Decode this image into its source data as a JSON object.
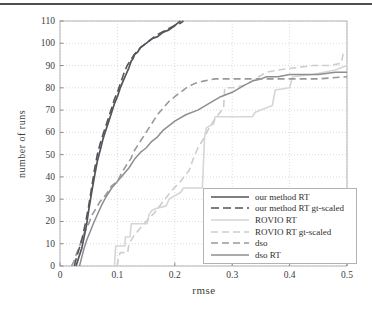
{
  "page": {
    "background": "#ffffff",
    "top_rule_color": "#4f4f4f"
  },
  "chart_data": {
    "type": "line",
    "title": "",
    "xlabel": "rmse",
    "ylabel": "number of runs",
    "xlim": [
      0,
      0.5
    ],
    "ylim": [
      0,
      110
    ],
    "grid": true,
    "legend_position": "lower-right",
    "frame_color": "#b3b3b3",
    "grid_color": "#dcdcdc",
    "tick_color": "#8a8a8a",
    "tick_label_color": "#3d3d3d",
    "xticks": {
      "values": [
        0,
        0.1,
        0.2,
        0.3,
        0.4,
        0.5
      ],
      "labels": [
        "0",
        "0.1",
        "0.2",
        "0.3",
        "0.4",
        "0.5"
      ]
    },
    "yticks": {
      "values": [
        0,
        10,
        20,
        30,
        40,
        50,
        60,
        70,
        80,
        90,
        100,
        110
      ],
      "labels": [
        "0",
        "10",
        "20",
        "30",
        "40",
        "50",
        "60",
        "70",
        "80",
        "90",
        "100",
        "110"
      ]
    },
    "series": [
      {
        "name": "our method RT",
        "color": "#54545a",
        "dash": "solid",
        "width": 1.7,
        "points": [
          [
            0.028,
            0
          ],
          [
            0.033,
            4
          ],
          [
            0.038,
            8
          ],
          [
            0.042,
            13
          ],
          [
            0.046,
            18
          ],
          [
            0.05,
            25
          ],
          [
            0.055,
            33
          ],
          [
            0.06,
            40
          ],
          [
            0.065,
            47
          ],
          [
            0.07,
            52
          ],
          [
            0.075,
            57
          ],
          [
            0.08,
            61
          ],
          [
            0.085,
            65
          ],
          [
            0.09,
            69
          ],
          [
            0.095,
            73
          ],
          [
            0.1,
            76
          ],
          [
            0.105,
            80
          ],
          [
            0.11,
            83
          ],
          [
            0.115,
            86
          ],
          [
            0.12,
            89
          ],
          [
            0.124,
            92
          ],
          [
            0.127,
            93
          ],
          [
            0.13,
            95
          ],
          [
            0.135,
            96
          ],
          [
            0.14,
            98
          ],
          [
            0.15,
            100
          ],
          [
            0.16,
            102
          ],
          [
            0.17,
            103
          ],
          [
            0.18,
            105
          ],
          [
            0.19,
            106
          ],
          [
            0.2,
            108
          ],
          [
            0.205,
            109
          ],
          [
            0.21,
            110
          ]
        ]
      },
      {
        "name": "our method RT gt-scaled",
        "color": "#54545a",
        "dash": "8,4",
        "width": 1.6,
        "points": [
          [
            0.025,
            0
          ],
          [
            0.03,
            5
          ],
          [
            0.036,
            10
          ],
          [
            0.04,
            14
          ],
          [
            0.045,
            20
          ],
          [
            0.05,
            27
          ],
          [
            0.055,
            35
          ],
          [
            0.06,
            43
          ],
          [
            0.065,
            50
          ],
          [
            0.07,
            55
          ],
          [
            0.075,
            59
          ],
          [
            0.08,
            63
          ],
          [
            0.085,
            67
          ],
          [
            0.09,
            71
          ],
          [
            0.095,
            75
          ],
          [
            0.1,
            78
          ],
          [
            0.104,
            81
          ],
          [
            0.108,
            84
          ],
          [
            0.112,
            87
          ],
          [
            0.117,
            90
          ],
          [
            0.122,
            92
          ],
          [
            0.127,
            94
          ],
          [
            0.133,
            96
          ],
          [
            0.14,
            98
          ],
          [
            0.15,
            100
          ],
          [
            0.16,
            102
          ],
          [
            0.17,
            104
          ],
          [
            0.185,
            106
          ],
          [
            0.2,
            108
          ],
          [
            0.21,
            109
          ],
          [
            0.215,
            110
          ]
        ]
      },
      {
        "name": "ROVIO RT",
        "color": "#d6d6d6",
        "dash": "solid",
        "width": 1.6,
        "points": [
          [
            0.095,
            0
          ],
          [
            0.096,
            5
          ],
          [
            0.097,
            9
          ],
          [
            0.113,
            9
          ],
          [
            0.114,
            13
          ],
          [
            0.122,
            13
          ],
          [
            0.124,
            19
          ],
          [
            0.152,
            19
          ],
          [
            0.155,
            23
          ],
          [
            0.16,
            25
          ],
          [
            0.17,
            26
          ],
          [
            0.185,
            27
          ],
          [
            0.19,
            30
          ],
          [
            0.196,
            31
          ],
          [
            0.21,
            33
          ],
          [
            0.215,
            35
          ],
          [
            0.248,
            35
          ],
          [
            0.252,
            58
          ],
          [
            0.255,
            62
          ],
          [
            0.268,
            64
          ],
          [
            0.27,
            67
          ],
          [
            0.335,
            67
          ],
          [
            0.34,
            69
          ],
          [
            0.37,
            72
          ],
          [
            0.372,
            75
          ],
          [
            0.375,
            79
          ],
          [
            0.4,
            80
          ],
          [
            0.405,
            85
          ],
          [
            0.44,
            86
          ],
          [
            0.46,
            87
          ],
          [
            0.48,
            88
          ],
          [
            0.5,
            90
          ]
        ]
      },
      {
        "name": "ROVIO RT gt-scaled",
        "color": "#cdcdcd",
        "dash": "7,4",
        "width": 1.6,
        "points": [
          [
            0.1,
            0
          ],
          [
            0.102,
            4
          ],
          [
            0.105,
            6
          ],
          [
            0.118,
            6
          ],
          [
            0.12,
            10
          ],
          [
            0.13,
            14
          ],
          [
            0.14,
            17
          ],
          [
            0.15,
            20
          ],
          [
            0.165,
            24
          ],
          [
            0.18,
            29
          ],
          [
            0.195,
            34
          ],
          [
            0.21,
            38
          ],
          [
            0.225,
            43
          ],
          [
            0.232,
            48
          ],
          [
            0.24,
            53
          ],
          [
            0.25,
            57
          ],
          [
            0.26,
            62
          ],
          [
            0.27,
            66
          ],
          [
            0.282,
            70
          ],
          [
            0.285,
            71
          ],
          [
            0.287,
            80
          ],
          [
            0.3,
            80
          ],
          [
            0.32,
            81
          ],
          [
            0.335,
            83
          ],
          [
            0.34,
            84
          ],
          [
            0.36,
            87
          ],
          [
            0.38,
            88
          ],
          [
            0.41,
            89
          ],
          [
            0.44,
            90
          ],
          [
            0.47,
            90
          ],
          [
            0.49,
            91
          ],
          [
            0.493,
            95
          ],
          [
            0.5,
            95
          ]
        ]
      },
      {
        "name": "dso",
        "color": "#99999d",
        "dash": "7,4",
        "width": 1.6,
        "points": [
          [
            0.02,
            0
          ],
          [
            0.024,
            2
          ],
          [
            0.028,
            5
          ],
          [
            0.033,
            8
          ],
          [
            0.038,
            12
          ],
          [
            0.044,
            16
          ],
          [
            0.05,
            19
          ],
          [
            0.056,
            23
          ],
          [
            0.063,
            26
          ],
          [
            0.07,
            29
          ],
          [
            0.08,
            32
          ],
          [
            0.09,
            36
          ],
          [
            0.1,
            38
          ],
          [
            0.108,
            42
          ],
          [
            0.115,
            45
          ],
          [
            0.123,
            48
          ],
          [
            0.13,
            52
          ],
          [
            0.14,
            56
          ],
          [
            0.15,
            60
          ],
          [
            0.16,
            64
          ],
          [
            0.17,
            68
          ],
          [
            0.18,
            71
          ],
          [
            0.19,
            74
          ],
          [
            0.2,
            76
          ],
          [
            0.21,
            78
          ],
          [
            0.22,
            80
          ],
          [
            0.235,
            82
          ],
          [
            0.25,
            83
          ],
          [
            0.27,
            84
          ],
          [
            0.3,
            84
          ],
          [
            0.35,
            84
          ],
          [
            0.4,
            84
          ],
          [
            0.45,
            84
          ],
          [
            0.5,
            85
          ]
        ]
      },
      {
        "name": "dso RT",
        "color": "#8e8e92",
        "dash": "solid",
        "width": 1.5,
        "points": [
          [
            0.034,
            0
          ],
          [
            0.038,
            4
          ],
          [
            0.042,
            8
          ],
          [
            0.047,
            12
          ],
          [
            0.052,
            15
          ],
          [
            0.058,
            19
          ],
          [
            0.065,
            23
          ],
          [
            0.072,
            27
          ],
          [
            0.08,
            31
          ],
          [
            0.09,
            35
          ],
          [
            0.1,
            38
          ],
          [
            0.11,
            41
          ],
          [
            0.12,
            44
          ],
          [
            0.13,
            48
          ],
          [
            0.14,
            51
          ],
          [
            0.15,
            53
          ],
          [
            0.16,
            56
          ],
          [
            0.17,
            58
          ],
          [
            0.18,
            61
          ],
          [
            0.19,
            63
          ],
          [
            0.2,
            65
          ],
          [
            0.22,
            68
          ],
          [
            0.24,
            70
          ],
          [
            0.26,
            73
          ],
          [
            0.28,
            76
          ],
          [
            0.3,
            78
          ],
          [
            0.32,
            81
          ],
          [
            0.335,
            83
          ],
          [
            0.35,
            84
          ],
          [
            0.36,
            85
          ],
          [
            0.38,
            85
          ],
          [
            0.4,
            86
          ],
          [
            0.45,
            86
          ],
          [
            0.48,
            87
          ],
          [
            0.5,
            87
          ]
        ]
      }
    ]
  }
}
